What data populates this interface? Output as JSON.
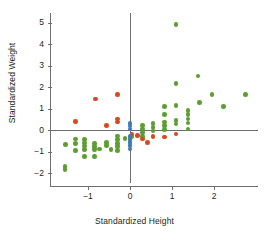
{
  "chart_data": {
    "type": "scatter",
    "title": "",
    "xlabel": "Standardized Height",
    "ylabel": "Standardized Weight",
    "xlim": [
      -1.85,
      3.05
    ],
    "ylim": [
      -2.45,
      5.45
    ],
    "xticks": [
      -1,
      0,
      1,
      2
    ],
    "xtick_labels": [
      "−1",
      "0",
      "1",
      "2"
    ],
    "yticks": [
      -2,
      -1,
      0,
      1,
      2,
      3,
      4,
      5
    ],
    "ytick_labels": [
      "−2",
      "−1",
      "0",
      "1",
      "2",
      "3",
      "4",
      "5"
    ],
    "grid": false,
    "legend": "none",
    "origin_axes": true,
    "colors": {
      "green": "#5c9e31",
      "red": "#d9481e",
      "blue": "#3d7bb5",
      "axis": "#6d6e70",
      "text": "#231f20",
      "background": "#ffffff"
    },
    "series": [
      {
        "name": "green",
        "color": "#5c9e31",
        "points": [
          [
            -1.55,
            -1.7
          ],
          [
            -1.55,
            -1.85
          ],
          [
            -1.53,
            -0.68
          ],
          [
            -1.3,
            -0.42
          ],
          [
            -1.3,
            -0.62
          ],
          [
            -1.3,
            -0.95
          ],
          [
            -1.08,
            -0.45
          ],
          [
            -1.08,
            -0.6
          ],
          [
            -1.08,
            -0.75
          ],
          [
            -1.08,
            -0.9
          ],
          [
            -1.08,
            -1.22
          ],
          [
            -0.85,
            -0.62
          ],
          [
            -0.85,
            -0.78
          ],
          [
            -0.85,
            -0.92
          ],
          [
            -0.85,
            -1.22
          ],
          [
            -0.72,
            -0.88
          ],
          [
            -0.56,
            -0.58
          ],
          [
            -0.56,
            -0.72
          ],
          [
            -0.45,
            -0.92
          ],
          [
            -0.3,
            -0.28
          ],
          [
            -0.3,
            -0.45
          ],
          [
            -0.3,
            -0.62
          ],
          [
            -0.3,
            -0.78
          ],
          [
            -0.3,
            -0.95
          ],
          [
            -0.12,
            -0.4
          ],
          [
            0.05,
            -0.3
          ],
          [
            0.3,
            0.22
          ],
          [
            0.3,
            0.05
          ],
          [
            0.3,
            -0.12
          ],
          [
            0.3,
            -0.3
          ],
          [
            0.55,
            0.3
          ],
          [
            0.55,
            0.12
          ],
          [
            0.55,
            -0.05
          ],
          [
            0.82,
            1.1
          ],
          [
            0.82,
            0.72
          ],
          [
            0.82,
            0.38
          ],
          [
            0.82,
            0.2
          ],
          [
            0.82,
            0.02
          ],
          [
            1.1,
            4.9
          ],
          [
            1.1,
            2.15
          ],
          [
            1.1,
            1.15
          ],
          [
            1.1,
            0.45
          ],
          [
            1.1,
            0.28
          ],
          [
            1.38,
            0.92
          ],
          [
            1.38,
            0.72
          ],
          [
            1.38,
            0.52
          ],
          [
            1.38,
            0.32
          ],
          [
            1.38,
            0.05
          ],
          [
            1.62,
            2.52
          ],
          [
            1.65,
            1.28
          ],
          [
            1.95,
            1.65
          ],
          [
            2.22,
            1.1
          ],
          [
            2.75,
            1.65
          ]
        ]
      },
      {
        "name": "red",
        "color": "#d9481e",
        "points": [
          [
            -1.3,
            0.4
          ],
          [
            -0.82,
            1.45
          ],
          [
            -0.56,
            0.2
          ],
          [
            -0.3,
            1.65
          ],
          [
            -0.3,
            0.52
          ],
          [
            -0.3,
            0.38
          ],
          [
            0.05,
            -0.18
          ],
          [
            0.18,
            -0.25
          ],
          [
            0.3,
            -0.42
          ],
          [
            0.42,
            -0.58
          ],
          [
            0.55,
            -0.3
          ],
          [
            0.82,
            -0.32
          ],
          [
            1.1,
            -0.18
          ]
        ]
      },
      {
        "name": "blue",
        "color": "#3d7bb5",
        "points": [
          [
            0.0,
            0.3
          ],
          [
            0.0,
            0.18
          ],
          [
            0.0,
            0.05
          ],
          [
            0.0,
            -0.3
          ],
          [
            0.0,
            -0.45
          ],
          [
            0.0,
            -0.58
          ],
          [
            0.0,
            -0.72
          ],
          [
            0.0,
            -0.88
          ]
        ]
      }
    ]
  }
}
